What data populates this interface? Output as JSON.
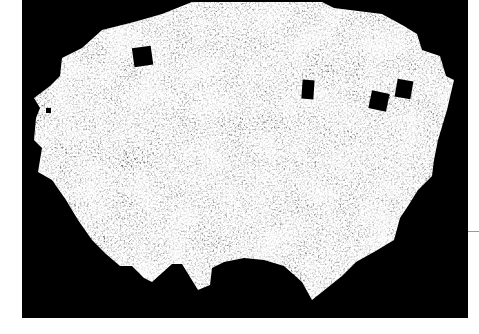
{
  "image": {
    "kind": "galaxy-survey-sky-map",
    "background_color": "#000000",
    "page_color": "#ffffff",
    "map_tone": "grayscale",
    "masked_holes": 5
  }
}
